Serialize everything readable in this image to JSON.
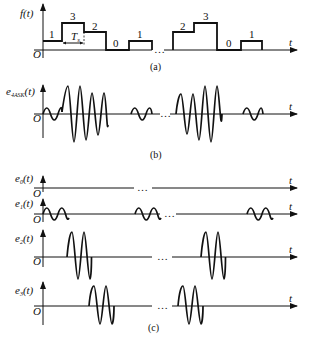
{
  "figure": {
    "panel_a": {
      "caption": "(a)",
      "y_label": "f(t)",
      "x_label": "t",
      "origin_label": "O",
      "symbol_levels": [
        "1",
        "3",
        "2",
        "0",
        "1",
        "2",
        "3",
        "0",
        "1"
      ],
      "symbol_period_label": "T",
      "symbol_period_sub": "s",
      "ellipsis": "…"
    },
    "panel_b": {
      "caption": "(b)",
      "y_label": "e",
      "y_label_sub": "4ASK",
      "y_label_suffix": "(t)",
      "x_label": "t",
      "origin_label": "O",
      "ellipsis": "…"
    },
    "panel_c": {
      "caption": "(c)",
      "rows": [
        {
          "y_label": "e",
          "sub": "0",
          "suffix": "(t)",
          "x_label": "t",
          "origin_label": "O",
          "ellipsis": "…"
        },
        {
          "y_label": "e",
          "sub": "1",
          "suffix": "(t)",
          "x_label": "t",
          "origin_label": "O",
          "ellipsis": "…"
        },
        {
          "y_label": "e",
          "sub": "2",
          "suffix": "(t)",
          "x_label": "t",
          "origin_label": "O",
          "ellipsis": "…"
        },
        {
          "y_label": "e",
          "sub": "3",
          "suffix": "(t)",
          "x_label": "t",
          "origin_label": "O",
          "ellipsis": "…"
        }
      ]
    }
  }
}
